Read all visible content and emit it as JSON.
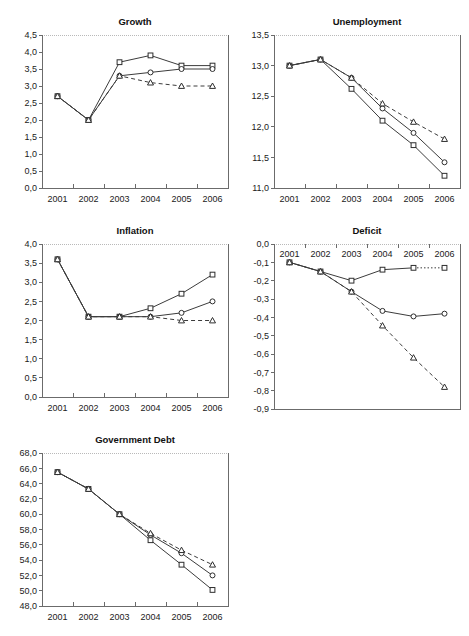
{
  "page": {
    "top_fragment": "",
    "background": "#ffffff"
  },
  "panels": [
    {
      "id": "growth",
      "title": "Growth"
    },
    {
      "id": "unemployment",
      "title": "Unemployment"
    },
    {
      "id": "inflation",
      "title": "Inflation"
    },
    {
      "id": "deficit",
      "title": "Deficit"
    },
    {
      "id": "debt",
      "title": "Government Debt"
    }
  ],
  "chart_data": [
    {
      "id": "growth",
      "type": "line",
      "title": "Growth",
      "xlabel": "",
      "ylabel": "",
      "categories": [
        "2001",
        "2002",
        "2003",
        "2004",
        "2005",
        "2006"
      ],
      "x_tick_labels": [
        "2001",
        "2002",
        "2003",
        "2004",
        "2005",
        "2006"
      ],
      "y_tick_labels": [
        "0,0",
        "0,5",
        "1,0",
        "1,5",
        "2,0",
        "2,5",
        "3,0",
        "3,5",
        "4,0",
        "4,5"
      ],
      "ylim": [
        0.0,
        4.5
      ],
      "ytick_step": 0.5,
      "grid": "top-only",
      "legend": "none",
      "series": [
        {
          "name": "series-1",
          "marker": "square",
          "line": "solid",
          "values": [
            2.7,
            2.0,
            3.7,
            3.9,
            3.6,
            3.6
          ]
        },
        {
          "name": "series-2",
          "marker": "circle",
          "line": "solid",
          "values": [
            2.7,
            2.0,
            3.3,
            3.4,
            3.5,
            3.5
          ]
        },
        {
          "name": "series-3",
          "marker": "triangle",
          "line": "dashed",
          "values": [
            2.7,
            2.0,
            3.3,
            3.1,
            3.0,
            3.0
          ]
        }
      ]
    },
    {
      "id": "unemployment",
      "type": "line",
      "title": "Unemployment",
      "xlabel": "",
      "ylabel": "",
      "categories": [
        "2001",
        "2002",
        "2003",
        "2004",
        "2005",
        "2006"
      ],
      "x_tick_labels": [
        "2001",
        "2002",
        "2003",
        "2004",
        "2005",
        "2006"
      ],
      "y_tick_labels": [
        "11,0",
        "11,5",
        "12,0",
        "12,5",
        "13,0",
        "13,5"
      ],
      "ylim": [
        11.0,
        13.5
      ],
      "ytick_step": 0.5,
      "grid": "top-only",
      "legend": "none",
      "series": [
        {
          "name": "series-1",
          "marker": "square",
          "line": "solid",
          "values": [
            13.0,
            13.1,
            12.62,
            12.1,
            11.7,
            11.2
          ]
        },
        {
          "name": "series-2",
          "marker": "circle",
          "line": "solid",
          "values": [
            13.0,
            13.1,
            12.8,
            12.3,
            11.9,
            11.42
          ]
        },
        {
          "name": "series-3",
          "marker": "triangle",
          "line": "dashed",
          "values": [
            13.0,
            13.1,
            12.8,
            12.38,
            12.08,
            11.8
          ]
        }
      ]
    },
    {
      "id": "inflation",
      "type": "line",
      "title": "Inflation",
      "xlabel": "",
      "ylabel": "",
      "categories": [
        "2001",
        "2002",
        "2003",
        "2004",
        "2005",
        "2006"
      ],
      "x_tick_labels": [
        "2001",
        "2002",
        "2003",
        "2004",
        "2005",
        "2006"
      ],
      "y_tick_labels": [
        "0,0",
        "0,5",
        "1,0",
        "1,5",
        "2,0",
        "2,5",
        "3,0",
        "3,5",
        "4,0"
      ],
      "ylim": [
        0.0,
        4.0
      ],
      "ytick_step": 0.5,
      "grid": "top-only",
      "legend": "none",
      "series": [
        {
          "name": "series-1",
          "marker": "square",
          "line": "solid",
          "values": [
            3.6,
            2.1,
            2.1,
            2.32,
            2.7,
            3.2
          ]
        },
        {
          "name": "series-2",
          "marker": "circle",
          "line": "solid",
          "values": [
            3.6,
            2.1,
            2.1,
            2.1,
            2.2,
            2.5
          ]
        },
        {
          "name": "series-3",
          "marker": "triangle",
          "line": "dashed",
          "values": [
            3.6,
            2.1,
            2.1,
            2.1,
            2.0,
            2.0
          ]
        }
      ]
    },
    {
      "id": "deficit",
      "type": "line",
      "title": "Deficit",
      "xlabel": "",
      "ylabel": "",
      "categories": [
        "2001",
        "2002",
        "2003",
        "2004",
        "2005",
        "2006"
      ],
      "x_tick_labels": [
        "2001",
        "2002",
        "2003",
        "2004",
        "2005",
        "2006"
      ],
      "x_axis_labels_position": "top",
      "y_tick_labels": [
        "-0,9",
        "-0,8",
        "-0,7",
        "-0,6",
        "-0,5",
        "-0,4",
        "-0,3",
        "-0,2",
        "-0,1",
        "0,0"
      ],
      "ylim": [
        -0.9,
        0.0
      ],
      "ytick_step": 0.1,
      "grid": "top-only",
      "legend": "none",
      "series": [
        {
          "name": "series-1",
          "marker": "square",
          "line": "solid-dotted-tail",
          "values": [
            -0.1,
            -0.15,
            -0.2,
            -0.14,
            -0.13,
            -0.13
          ]
        },
        {
          "name": "series-2",
          "marker": "circle",
          "line": "solid",
          "values": [
            -0.1,
            -0.15,
            -0.26,
            -0.365,
            -0.395,
            -0.38
          ]
        },
        {
          "name": "series-3",
          "marker": "triangle",
          "line": "dashed",
          "values": [
            -0.1,
            -0.15,
            -0.26,
            -0.445,
            -0.62,
            -0.78
          ]
        }
      ]
    },
    {
      "id": "debt",
      "type": "line",
      "title": "Government Debt",
      "xlabel": "",
      "ylabel": "",
      "categories": [
        "2001",
        "2002",
        "2003",
        "2004",
        "2005",
        "2006"
      ],
      "x_tick_labels": [
        "2001",
        "2002",
        "2003",
        "2004",
        "2005",
        "2006"
      ],
      "y_tick_labels": [
        "48,0",
        "50,0",
        "52,0",
        "54,0",
        "56,0",
        "58,0",
        "60,0",
        "62,0",
        "64,0",
        "66,0",
        "68,0"
      ],
      "ylim": [
        48.0,
        68.0
      ],
      "ytick_step": 2.0,
      "grid": "top-only",
      "legend": "none",
      "series": [
        {
          "name": "series-1",
          "marker": "square",
          "line": "solid",
          "values": [
            65.5,
            63.3,
            60.0,
            56.6,
            53.4,
            50.1
          ]
        },
        {
          "name": "series-2",
          "marker": "circle",
          "line": "solid",
          "values": [
            65.5,
            63.3,
            60.0,
            57.3,
            54.9,
            52.0
          ]
        },
        {
          "name": "series-3",
          "marker": "triangle",
          "line": "dashed",
          "values": [
            65.5,
            63.3,
            60.0,
            57.5,
            55.3,
            53.4
          ]
        }
      ]
    }
  ]
}
